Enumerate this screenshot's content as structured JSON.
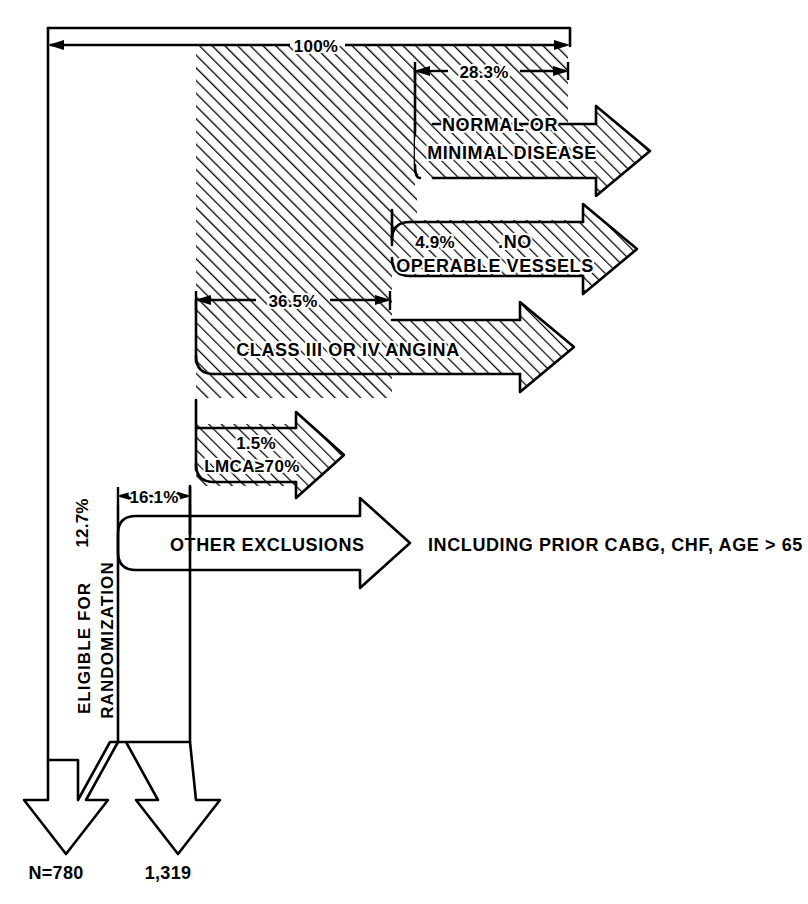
{
  "diagram": {
    "colors": {
      "ink": "#000000",
      "paper": "#ffffff"
    },
    "hatch": {
      "angle_deg": 45,
      "spacing_px": 9
    }
  },
  "dimensions": {
    "total": {
      "label": "100%",
      "value": 100
    },
    "normal_minimal": {
      "label": "28.3%",
      "value": 28.3
    },
    "class_iii_iv": {
      "label": "36.5%",
      "value": 36.5
    },
    "other_exclusions": {
      "label": "16.1%",
      "value": 16.1
    }
  },
  "branches": [
    {
      "id": "normal-or-minimal-disease",
      "percent": "28.3%",
      "text_lines": [
        "NORMAL OR",
        "MINIMAL DISEASE"
      ],
      "hatched": true
    },
    {
      "id": "no-operable-vessels",
      "percent": "4.9%",
      "text_lines": [
        ".NO",
        "OPERABLE VESSELS"
      ],
      "hatched": true
    },
    {
      "id": "class-iii-or-iv-angina",
      "percent": "36.5%",
      "text_lines": [
        "CLASS III OR IV ANGINA"
      ],
      "hatched": true
    },
    {
      "id": "lmca-70",
      "percent": "1.5%",
      "text_lines": [
        "LMCA≥70%"
      ],
      "hatched": true
    },
    {
      "id": "other-exclusions",
      "percent": "16.1%",
      "text_lines": [
        "OTHER EXCLUSIONS"
      ],
      "note": "INCLUDING PRIOR CABG, CHF, AGE > 65",
      "hatched": false
    }
  ],
  "labels": {
    "pct_100": "100%",
    "pct_283": "28.3%",
    "pct_49": "4.9%",
    "pct_365": "36.5%",
    "pct_15": "1.5%",
    "pct_161": "16.1%",
    "pct_127": "12.7%",
    "normal_line1": "NORMAL OR",
    "normal_line2": "MINIMAL DISEASE",
    "novessels_line1": ".NO",
    "novessels_line2": "OPERABLE VESSELS",
    "class_angina": "CLASS III OR IV ANGINA",
    "lmca": "LMCA≥70%",
    "other_exclusions": "OTHER EXCLUSIONS",
    "including_note": "INCLUDING PRIOR CABG, CHF, AGE > 65",
    "eligible_line1": "ELIGIBLE FOR",
    "eligible_line2": "RANDOMIZATION",
    "n_780": "N=780",
    "n_1319": "1,319"
  },
  "outcomes": [
    {
      "id": "randomized",
      "label": "N=780",
      "value": 780
    },
    {
      "id": "eligible-not-randomized",
      "label": "1,319",
      "value": 1319
    }
  ]
}
